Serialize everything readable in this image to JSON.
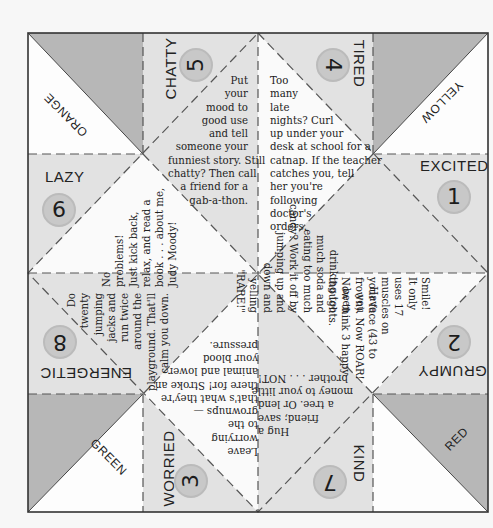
{
  "colors": {
    "background": "#f7f7f7",
    "gray_triangle": "#b7b7b7",
    "light_panel": "#e2e2e2",
    "white_panel": "#fafafa",
    "frame": "#333333",
    "dash": "#555555",
    "circle": "#c8c8c8"
  },
  "corners": {
    "top_left": "ORANGE",
    "top_right": "YELLOW",
    "bottom_left": "GREEN",
    "bottom_right": "RED"
  },
  "moods": [
    {
      "number": "1",
      "label": "EXCITED",
      "text": [
        "Have",
        "you",
        "been",
        "drinking too",
        "much soda and",
        "eating too much",
        "candy? Work it off by",
        "jumping up and",
        "down and",
        "yelling",
        "\"RARE!\""
      ]
    },
    {
      "number": "2",
      "label": "GRUMPY",
      "text": [
        "Smile!",
        "It only",
        "uses 17",
        "muscles on",
        "your face (43 to",
        "frown). Now ROAR!",
        "Now think 3 happy",
        "thoughts."
      ]
    },
    {
      "number": "3",
      "label": "WORRIED",
      "text": [
        "Leave",
        "worrying",
        "to the",
        "grownups —",
        "that's what they're",
        "there for! Stroke an",
        "animal and lower",
        "your blood",
        "pressure."
      ]
    },
    {
      "number": "4",
      "label": "TIRED",
      "text": [
        "Too",
        "many",
        "late",
        "nights? Curl",
        "up under your",
        "desk at school for a",
        "catnap. If the teacher",
        "catches you, tell",
        "her you're",
        "following",
        "doctor's",
        "orders."
      ]
    },
    {
      "number": "5",
      "label": "CHATTY",
      "text": [
        "Put",
        "your",
        "mood to",
        "good use",
        "and tell",
        "someone your",
        "funniest story. Still",
        "chatty? Then call",
        "a friend for a",
        "gab-a-thon."
      ]
    },
    {
      "number": "6",
      "label": "LAZY",
      "text": [
        "No",
        "problems!",
        "Just kick back,",
        "relax, and read a",
        "book . . . about me,",
        "Judy Moody!"
      ]
    },
    {
      "number": "7",
      "label": "KIND",
      "text": [
        "Hug a",
        "friend; save",
        "a tree. Or lend",
        "money to your little",
        "brother . . . NOT!"
      ]
    },
    {
      "number": "8",
      "label": "ENERGETIC",
      "text": [
        "Do",
        "twenty",
        "jumping",
        "jacks and",
        "run twice",
        "around the",
        "playground. That'll",
        "calm you down."
      ]
    }
  ]
}
